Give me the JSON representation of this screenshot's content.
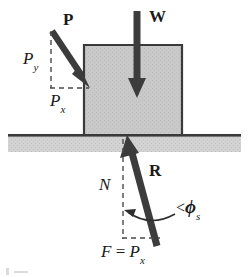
{
  "figure": {
    "caption_fragment": "",
    "colors": {
      "arrow": "#3c3c3c",
      "block_fill": "#c9c9c9",
      "block_stroke": "#3a3a3a",
      "ground_fill": "#cfcfcf",
      "ground_line": "#3a3a3a",
      "dashed": "#4a4a4a",
      "text": "#1a1a1a",
      "background": "#ffffff"
    }
  },
  "labels": {
    "applied_force": "P",
    "weight": "W",
    "p_vertical_component": "P",
    "p_vertical_component_sub": "y",
    "p_horizontal_component": "P",
    "p_horizontal_component_sub": "x",
    "normal_force": "N",
    "resultant": "R",
    "friction_angle_prefix": "<",
    "friction_angle_symbol": "ϕ",
    "friction_angle_sub": "s",
    "friction_eq_F": "F",
    "friction_eq_equals": "=",
    "friction_eq_P": "P",
    "friction_eq_P_sub": "x"
  },
  "geometry": {
    "block": {
      "x": 84,
      "y": 45,
      "width": 98,
      "height": 89
    },
    "ground": {
      "x": 8,
      "y": 134,
      "width": 233,
      "height": 18
    },
    "arrows": [
      {
        "name": "P",
        "x1": 52,
        "y1": 31,
        "x2": 88,
        "y2": 85,
        "head": "end"
      },
      {
        "name": "W",
        "x1": 137,
        "y1": 11,
        "x2": 137,
        "y2": 96,
        "head": "end"
      },
      {
        "name": "R",
        "x1": 157,
        "y1": 246,
        "x2": 127,
        "y2": 136,
        "head": "end"
      }
    ],
    "dashed_lines": [
      {
        "name": "Py-guide-vertical",
        "x1": 51,
        "y1": 31,
        "x2": 51,
        "y2": 88
      },
      {
        "name": "Px-guide-horizontal",
        "x1": 51,
        "y1": 88,
        "x2": 88,
        "y2": 88
      },
      {
        "name": "N-guide-vertical",
        "x1": 123,
        "y1": 138,
        "x2": 123,
        "y2": 238
      },
      {
        "name": "F-guide-horizontal",
        "x1": 123,
        "y1": 238,
        "x2": 158,
        "y2": 238
      }
    ],
    "angle_arc": {
      "cx": 123,
      "cy": 238,
      "r": 30,
      "from_deg": 270,
      "to_deg": 290
    }
  }
}
